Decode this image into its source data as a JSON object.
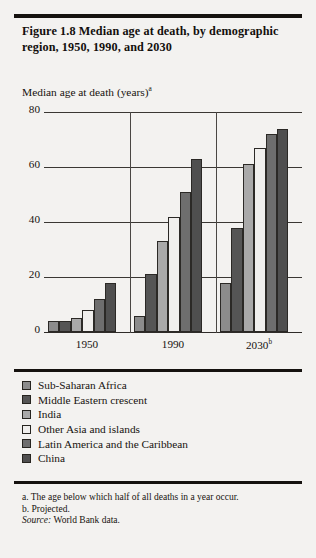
{
  "figure": {
    "title": "Figure 1.8  Median age at death, by demographic region, 1950, 1990, and 2030",
    "axis_title": "Median age at death (years)",
    "axis_title_superscript": "a"
  },
  "notes": {
    "note_a": "a. The age below which half of all deaths in a year occur.",
    "note_b": "b. Projected.",
    "source_label": "Source:",
    "source_text": "World Bank data."
  },
  "legend": {
    "items": [
      {
        "label": "Sub-Saharan Africa",
        "color": "#8c8c8c"
      },
      {
        "label": "Middle Eastern crescent",
        "color": "#555555"
      },
      {
        "label": "India",
        "color": "#a9a9a9"
      },
      {
        "label": "Other Asia and islands",
        "color": "#f0efed"
      },
      {
        "label": "Latin America and the Caribbean",
        "color": "#6e6e6e"
      },
      {
        "label": "China",
        "color": "#4f4f4f"
      }
    ]
  },
  "chart_data": {
    "type": "bar",
    "title": "Figure 1.8  Median age at death, by demographic region, 1950, 1990, and 2030",
    "xlabel": "",
    "ylabel": "Median age at death (years)",
    "ylim": [
      0,
      80
    ],
    "yticks": [
      0,
      20,
      40,
      60,
      80
    ],
    "grid": true,
    "legend_position": "below-plot",
    "categories": [
      "1950",
      "1990",
      "2030"
    ],
    "category_tick_labels": [
      "1950",
      "1990",
      "2030"
    ],
    "category_tick_superscripts": [
      "",
      "",
      "b"
    ],
    "series": [
      {
        "name": "Sub-Saharan Africa",
        "color": "#8c8c8c",
        "values": [
          4,
          6,
          18
        ]
      },
      {
        "name": "Middle Eastern crescent",
        "color": "#555555",
        "values": [
          4,
          21,
          38
        ]
      },
      {
        "name": "India",
        "color": "#a9a9a9",
        "values": [
          5,
          33,
          61
        ]
      },
      {
        "name": "Other Asia and islands",
        "color": "#f0efed",
        "values": [
          8,
          42,
          67
        ]
      },
      {
        "name": "Latin America and the Caribbean",
        "color": "#6e6e6e",
        "values": [
          12,
          51,
          72
        ]
      },
      {
        "name": "China",
        "color": "#4f4f4f",
        "values": [
          18,
          63,
          74
        ]
      }
    ]
  }
}
